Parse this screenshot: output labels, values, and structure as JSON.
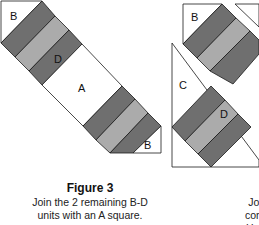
{
  "colors": {
    "dark": "#6f6f6f",
    "light": "#ababab",
    "white": "#ffffff",
    "stroke": "#1a1a1a"
  },
  "figure3": {
    "labels": {
      "b_top": "B",
      "d": "D",
      "a": "A",
      "b_bottom": "B"
    },
    "caption_title": "Figure 3",
    "caption_line1": "Join the 2 remaining B-D",
    "caption_line2": "units with an A square."
  },
  "figure4": {
    "labels": {
      "b": "B",
      "c": "C",
      "d": "D"
    },
    "caption_title": "Figu",
    "caption_line1": "Join the pie",
    "caption_line2": "complete the",
    "caption_line3": "House, Jack"
  }
}
